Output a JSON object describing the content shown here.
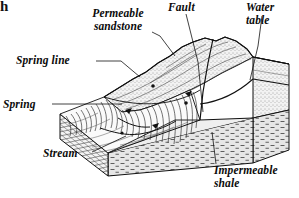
{
  "figure": {
    "kind": "geological-block-diagram",
    "background_color": "#ffffff",
    "ink_color": "#111111",
    "corner_mark": "h"
  },
  "labels": {
    "permeable_sandstone": "Permeable\nsandstone",
    "permeable_sandstone_line1": "Permeable",
    "permeable_sandstone_line2": "sandstone",
    "spring_line": "Spring line",
    "spring": "Spring",
    "stream": "Stream",
    "fault": "Fault",
    "water_table_line1": "Water",
    "water_table_line2": "table",
    "impermeable_shale_line1": "Impermeable",
    "impermeable_shale_line2": "shale"
  },
  "strata": [
    {
      "name": "Permeable sandstone",
      "pattern": "stipple",
      "color": "#e8e8e8"
    },
    {
      "name": "Impermeable shale",
      "pattern": "dash",
      "color": "#dcdcdc"
    }
  ],
  "features": [
    {
      "name": "Fault",
      "type": "line"
    },
    {
      "name": "Water table",
      "type": "line"
    },
    {
      "name": "Spring line",
      "type": "line"
    },
    {
      "name": "Spring",
      "type": "point"
    },
    {
      "name": "Stream",
      "type": "channel"
    }
  ]
}
